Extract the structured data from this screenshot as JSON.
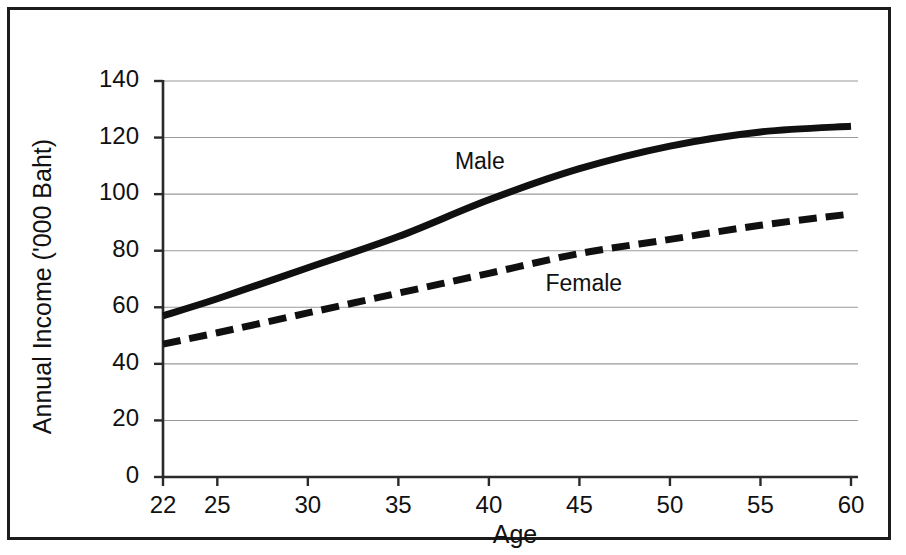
{
  "chart_data": {
    "type": "line",
    "title": "",
    "xlabel": "Age",
    "ylabel": "Annual Income ('000 Baht)",
    "xlim": [
      22,
      60
    ],
    "ylim": [
      0,
      140
    ],
    "grid": true,
    "grid_axis": "y",
    "legend_position": "inline-annotations",
    "x_tick_labels": [
      "22",
      "25",
      "30",
      "35",
      "40",
      "45",
      "50",
      "55",
      "60"
    ],
    "x_ticks": [
      22,
      25,
      30,
      35,
      40,
      45,
      50,
      55,
      60
    ],
    "y_tick_labels": [
      "0",
      "20",
      "40",
      "60",
      "80",
      "100",
      "120",
      "140"
    ],
    "y_ticks": [
      0,
      20,
      40,
      60,
      80,
      100,
      120,
      140
    ],
    "x": [
      22,
      25,
      30,
      35,
      40,
      45,
      50,
      55,
      60
    ],
    "series": [
      {
        "name": "Male",
        "style": "solid",
        "color": "#101010",
        "width": 7,
        "values": [
          57,
          63,
          74,
          85,
          98,
          109,
          117,
          122,
          124
        ],
        "label_x": 40,
        "label_y": 111
      },
      {
        "name": "Female",
        "style": "dashed",
        "color": "#101010",
        "width": 7,
        "values": [
          47,
          51,
          58,
          65,
          72,
          79,
          84,
          89,
          93
        ],
        "label_x": 45,
        "label_y": 68
      }
    ]
  },
  "figure": {
    "border_color": "#1c1c1c",
    "background": "#ffffff",
    "axis_color": "#2a2a2a",
    "grid_color": "#9a9a9a"
  }
}
